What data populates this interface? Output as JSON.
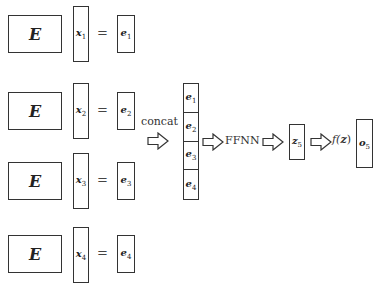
{
  "rows": [
    {
      "matrix": "E",
      "input_var": "x",
      "input_sub": "1",
      "equals": "=",
      "embed_var": "e",
      "embed_sub": "1"
    },
    {
      "matrix": "E",
      "input_var": "x",
      "input_sub": "2",
      "equals": "=",
      "embed_var": "e",
      "embed_sub": "2"
    },
    {
      "matrix": "E",
      "input_var": "x",
      "input_sub": "3",
      "equals": "=",
      "embed_var": "e",
      "embed_sub": "3"
    },
    {
      "matrix": "E",
      "input_var": "x",
      "input_sub": "4",
      "equals": "=",
      "embed_var": "e",
      "embed_sub": "4"
    }
  ],
  "concat": {
    "label": "concat",
    "cells": [
      {
        "var": "e",
        "sub": "1"
      },
      {
        "var": "e",
        "sub": "2"
      },
      {
        "var": "e",
        "sub": "3"
      },
      {
        "var": "e",
        "sub": "4"
      }
    ]
  },
  "ffnn": {
    "label": "FFNN"
  },
  "hidden": {
    "var": "z",
    "sub": "5"
  },
  "activation": {
    "label": "f(z)",
    "func": "f(",
    "arg": "z",
    "close": ")"
  },
  "output": {
    "var": "o",
    "sub": "5"
  }
}
